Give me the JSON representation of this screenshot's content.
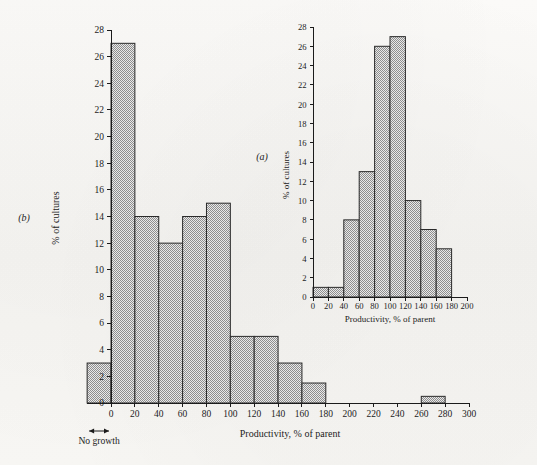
{
  "figure": {
    "background_color": "#f7f6f4",
    "ink_color": "#1b1b1b",
    "bar_fill_color": "#b9b9b9",
    "bar_stroke_color": "#2a2a2a"
  },
  "chart_data": [
    {
      "id": "panel-b",
      "type": "bar",
      "panel_label": "(b)",
      "title": "",
      "xlabel": "Productivity, % of parent",
      "ylabel": "% of cultures",
      "xlim": [
        -20,
        300
      ],
      "ylim": [
        0,
        28
      ],
      "xticks": [
        0,
        20,
        40,
        60,
        80,
        100,
        120,
        140,
        160,
        180,
        200,
        220,
        240,
        260,
        280,
        300
      ],
      "xtick_labels": [
        "0",
        "20",
        "40",
        "60",
        "80",
        "100",
        "120",
        "140",
        "160",
        "180",
        "200",
        "220",
        "240",
        "260",
        "280",
        "300"
      ],
      "yticks": [
        0,
        2,
        4,
        6,
        8,
        10,
        12,
        14,
        16,
        18,
        20,
        22,
        24,
        26,
        28
      ],
      "ytick_labels": [
        "0",
        "2",
        "4",
        "6",
        "8",
        "10",
        "12",
        "14",
        "16",
        "18",
        "20",
        "22",
        "24",
        "26",
        "28"
      ],
      "grid": false,
      "bin_width": 20,
      "bins": [
        {
          "x0": -20,
          "x1": 0,
          "value": 3
        },
        {
          "x0": 0,
          "x1": 20,
          "value": 27
        },
        {
          "x0": 20,
          "x1": 40,
          "value": 14
        },
        {
          "x0": 40,
          "x1": 60,
          "value": 12
        },
        {
          "x0": 60,
          "x1": 80,
          "value": 14
        },
        {
          "x0": 80,
          "x1": 100,
          "value": 15
        },
        {
          "x0": 100,
          "x1": 120,
          "value": 5
        },
        {
          "x0": 120,
          "x1": 140,
          "value": 5
        },
        {
          "x0": 140,
          "x1": 160,
          "value": 3
        },
        {
          "x0": 160,
          "x1": 180,
          "value": 1.5
        },
        {
          "x0": 180,
          "x1": 200,
          "value": 0
        },
        {
          "x0": 200,
          "x1": 220,
          "value": 0
        },
        {
          "x0": 220,
          "x1": 240,
          "value": 0
        },
        {
          "x0": 240,
          "x1": 260,
          "value": 0
        },
        {
          "x0": 260,
          "x1": 280,
          "value": 0.5
        },
        {
          "x0": 280,
          "x1": 300,
          "value": 0
        }
      ],
      "annotations": [
        {
          "name": "no-growth",
          "text": "No growth",
          "x0": -20,
          "x1": 0,
          "arrow": "double-headed"
        }
      ]
    },
    {
      "id": "panel-a",
      "type": "bar",
      "panel_label": "(a)",
      "title": "",
      "xlabel": "Productivity, % of parent",
      "ylabel": "% of cultures",
      "xlim": [
        0,
        200
      ],
      "ylim": [
        0,
        28
      ],
      "xticks": [
        0,
        20,
        40,
        60,
        80,
        100,
        120,
        140,
        160,
        180,
        200
      ],
      "xtick_labels": [
        "0",
        "20",
        "40",
        "60",
        "80",
        "100",
        "120",
        "140",
        "160",
        "180",
        "200"
      ],
      "yticks": [
        0,
        2,
        4,
        6,
        8,
        10,
        12,
        14,
        16,
        18,
        20,
        22,
        24,
        26,
        28
      ],
      "ytick_labels": [
        "0",
        "2",
        "4",
        "6",
        "8",
        "10",
        "12",
        "14",
        "16",
        "18",
        "20",
        "22",
        "24",
        "26",
        "28"
      ],
      "grid": false,
      "bin_width": 20,
      "bins": [
        {
          "x0": 0,
          "x1": 20,
          "value": 1
        },
        {
          "x0": 20,
          "x1": 40,
          "value": 1
        },
        {
          "x0": 40,
          "x1": 60,
          "value": 8
        },
        {
          "x0": 60,
          "x1": 80,
          "value": 13
        },
        {
          "x0": 80,
          "x1": 100,
          "value": 26
        },
        {
          "x0": 100,
          "x1": 120,
          "value": 27
        },
        {
          "x0": 120,
          "x1": 140,
          "value": 10
        },
        {
          "x0": 140,
          "x1": 160,
          "value": 7
        },
        {
          "x0": 160,
          "x1": 180,
          "value": 5
        },
        {
          "x0": 180,
          "x1": 200,
          "value": 0
        }
      ],
      "annotations": []
    }
  ]
}
